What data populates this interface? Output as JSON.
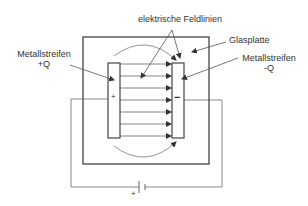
{
  "diagram": {
    "labels": {
      "field_lines": "elektrische Feldlinien",
      "glass_plate": "Glasplatte",
      "left_strip_name": "Metallstreifen",
      "left_strip_charge": "+Q",
      "right_strip_name": "Metallstreifen",
      "right_strip_charge": "-Q"
    },
    "symbols": {
      "plus_on_strip": "+",
      "minus_on_strip": "−",
      "battery_plus": "+"
    },
    "colors": {
      "line": "#444444",
      "light_line": "#888888",
      "text": "#333333"
    }
  }
}
